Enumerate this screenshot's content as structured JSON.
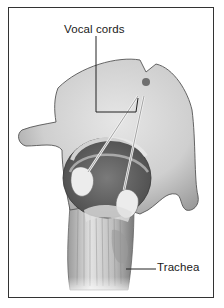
{
  "figure": {
    "labels": [
      {
        "id": "vocal-cords",
        "text": "Vocal cords"
      },
      {
        "id": "trachea",
        "text": "Trachea"
      }
    ]
  },
  "colors": {
    "frame": "#333333",
    "background": "#ffffff",
    "tissue_light": "#d8d8d8",
    "tissue_mid": "#a6a6a6",
    "tissue_dark": "#5a5a5a",
    "label_text": "#1a1a1a"
  }
}
